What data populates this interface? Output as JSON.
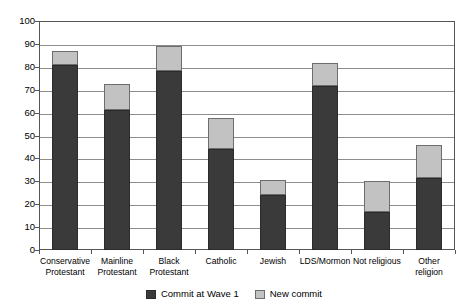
{
  "chart_data": {
    "type": "bar",
    "title": "",
    "subtitle": "",
    "xlabel": "",
    "ylabel": "",
    "stacked": true,
    "grid": true,
    "legend_position": "bottom",
    "ylim": [
      0,
      100
    ],
    "ytick_step": 10,
    "ytick_labels": [
      "0",
      "10",
      "20",
      "30",
      "40",
      "50",
      "60",
      "70",
      "80",
      "90",
      "100"
    ],
    "ytick_values": [
      0,
      10,
      20,
      30,
      40,
      50,
      60,
      70,
      80,
      90,
      100
    ],
    "categories": [
      "Conservative\nProtestant",
      "Mainline\nProtestant",
      "Black\nProtestant",
      "Catholic",
      "Jewish",
      "LDS/Mormon",
      "Not religious",
      "Other\nreligion"
    ],
    "series": [
      {
        "name": "Commit at Wave 1",
        "color": "#3a3a3a",
        "values": [
          81,
          61,
          78,
          44,
          24,
          71.5,
          16.5,
          31.5
        ]
      },
      {
        "name": "New commit",
        "color": "#c2c2c2",
        "values": [
          6,
          11.5,
          11,
          13.5,
          6.5,
          10,
          13.5,
          14.5
        ]
      }
    ],
    "totals": [
      87,
      72.5,
      89,
      57.5,
      30.5,
      81.5,
      30,
      46
    ]
  },
  "legend": {
    "items": [
      {
        "label": "Commit at Wave 1",
        "swatch": "dark"
      },
      {
        "label": "New commit",
        "swatch": "light"
      }
    ]
  },
  "colors": {
    "series_commit_wave1": "#3a3a3a",
    "series_new_commit": "#c2c2c2",
    "gridline": "#8d8d8d",
    "axis": "#555555",
    "background": "#ffffff"
  }
}
